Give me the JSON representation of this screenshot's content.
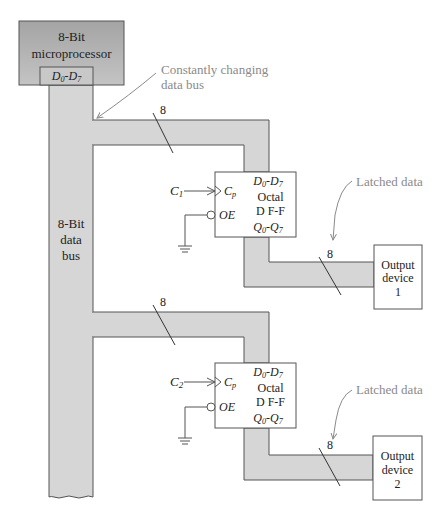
{
  "microprocessor": {
    "line1": "8-Bit",
    "line2": "microprocessor",
    "port": {
      "base": "D",
      "sub_from": "0",
      "sep": "-",
      "base2": "D",
      "sub_to": "7"
    }
  },
  "data_bus": {
    "line1": "8-Bit",
    "line2": "data",
    "line3": "bus"
  },
  "callouts": {
    "constantly_changing_line1": "Constantly changing",
    "constantly_changing_line2": "data bus",
    "latched_1": "Latched data",
    "latched_2": "Latched data"
  },
  "bus_width_labels": {
    "upper_input": "8",
    "upper_output": "8",
    "lower_input": "8",
    "lower_output": "8"
  },
  "flip_flops": [
    {
      "clock_label": "C",
      "clock_sub": "1",
      "d_label": {
        "base": "D",
        "sub_from": "0",
        "sep": "-",
        "base2": "D",
        "sub_to": "7"
      },
      "cp_label": "C",
      "cp_sub": "p",
      "oe_label": "OE",
      "title1": "Octal",
      "title2": "D F-F",
      "q_label": {
        "base": "Q",
        "sub_from": "0",
        "sep": "-",
        "base2": "Q",
        "sub_to": "7"
      }
    },
    {
      "clock_label": "C",
      "clock_sub": "2",
      "d_label": {
        "base": "D",
        "sub_from": "0",
        "sep": "-",
        "base2": "D",
        "sub_to": "7"
      },
      "cp_label": "C",
      "cp_sub": "p",
      "oe_label": "OE",
      "title1": "Octal",
      "title2": "D F-F",
      "q_label": {
        "base": "Q",
        "sub_from": "0",
        "sep": "-",
        "base2": "Q",
        "sub_to": "7"
      }
    }
  ],
  "output_devices": [
    {
      "line1": "Output",
      "line2": "device",
      "line3": "1"
    },
    {
      "line1": "Output",
      "line2": "device",
      "line3": "2"
    }
  ],
  "colors": {
    "bus_fill": "#d6d6d6",
    "micro_fill_top": "#a9a9a9",
    "micro_fill_bottom": "#c6c6c6",
    "stroke": "#555555",
    "callout": "#8a8a8a"
  }
}
